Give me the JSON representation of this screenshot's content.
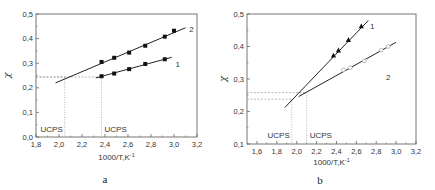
{
  "chart_data": [
    {
      "id": "a",
      "type": "scatter",
      "caption": "a",
      "xlabel": "1000/T,K⁻¹",
      "ylabel": "χ",
      "xlim": [
        1.8,
        3.2
      ],
      "ylim": [
        0.0,
        0.5
      ],
      "xticks": [
        "1,8",
        "2,0",
        "2,2",
        "2,4",
        "2,6",
        "2,8",
        "3,0",
        "3,2"
      ],
      "yticks": [
        "0,0",
        "0,1",
        "0,2",
        "0,3",
        "0,4",
        "0,5"
      ],
      "grid": false,
      "series": [
        {
          "name": "1",
          "marker": "square-filled",
          "x": [
            2.37,
            2.48,
            2.61,
            2.75,
            2.92
          ],
          "y": [
            0.247,
            0.258,
            0.276,
            0.297,
            0.316
          ],
          "fit_line": {
            "x": [
              2.32,
              2.98
            ],
            "y": [
              0.24,
              0.324
            ]
          }
        },
        {
          "name": "2",
          "marker": "square-filled",
          "x": [
            2.37,
            2.48,
            2.61,
            2.75,
            2.92,
            3.0
          ],
          "y": [
            0.305,
            0.322,
            0.343,
            0.371,
            0.408,
            0.432
          ],
          "fit_line": {
            "x": [
              1.97,
              3.1
            ],
            "y": [
              0.22,
              0.444
            ]
          }
        }
      ],
      "annotations": [
        {
          "text": "UCPS",
          "x": 2.05,
          "y_ref": 0.244,
          "note": "intersection with curve 2 extrapolation"
        },
        {
          "text": "UCPS",
          "x": 2.37,
          "y_ref": 0.244,
          "note": "start of curve 1"
        }
      ]
    },
    {
      "id": "b",
      "type": "scatter",
      "caption": "b",
      "xlabel": "1000/T,K⁻¹",
      "ylabel": "χ",
      "xlim": [
        1.5,
        3.2
      ],
      "ylim": [
        0.1,
        0.5
      ],
      "xticks": [
        "1,6",
        "1,8",
        "2,0",
        "2,2",
        "2,4",
        "2,6",
        "2,8",
        "3,0",
        "3,2"
      ],
      "yticks": [
        "0,1",
        "0,2",
        "0,3",
        "0,4",
        "0,5"
      ],
      "grid": false,
      "series": [
        {
          "name": "1",
          "marker": "triangle-filled",
          "x": [
            2.37,
            2.42,
            2.52,
            2.65
          ],
          "y": [
            0.372,
            0.388,
            0.42,
            0.462
          ],
          "fit_line": {
            "x": [
              1.88,
              2.72
            ],
            "y": [
              0.212,
              0.48
            ]
          }
        },
        {
          "name": "2",
          "marker": "circle-open",
          "x": [
            2.47,
            2.54,
            2.68,
            2.85,
            2.92
          ],
          "y": [
            0.328,
            0.335,
            0.356,
            0.389,
            0.4
          ],
          "fit_line": {
            "x": [
              2.02,
              3.0
            ],
            "y": [
              0.246,
              0.413
            ]
          }
        }
      ],
      "annotations": [
        {
          "text": "UCPS",
          "x": 1.95,
          "y_ref": 0.238
        },
        {
          "text": "UCPS",
          "x": 2.1,
          "y_ref": 0.258
        }
      ]
    }
  ],
  "labels": {
    "ucps": "UCPS",
    "caption_a": "a",
    "caption_b": "b",
    "xlabel": "1000/T,K",
    "xlabel_sup": "-1",
    "ylabel": "χ"
  }
}
